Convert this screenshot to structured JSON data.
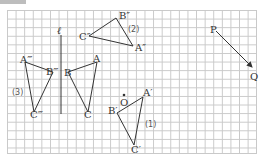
{
  "figure": {
    "line_label": "ℓ",
    "point_O": "O",
    "point_P": "P",
    "point_Q": "Q",
    "triangle_original": {
      "A": "A",
      "B": "B",
      "C": "C"
    },
    "triangle_1": {
      "A": "A′",
      "B": "B′",
      "C": "C′",
      "label": "(1)"
    },
    "triangle_2": {
      "A": "A″",
      "B": "B″",
      "C": "C″",
      "label": "(2)"
    },
    "triangle_3": {
      "A": "A‴",
      "B": "B‴",
      "C": "C‴",
      "label": "(3)"
    }
  },
  "colors": {
    "grid": "#c9c9c9",
    "stroke": "#333333"
  }
}
